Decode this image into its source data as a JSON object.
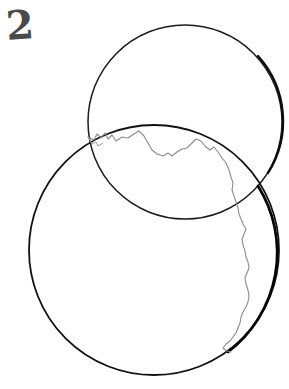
{
  "figure": {
    "number_label": "2",
    "caption": "",
    "background_color": "#ffffff",
    "ink_color": "#1a1a1a",
    "faint_ink_color": "#8a8a8a",
    "number_color": "#4a4a4a",
    "width": 289,
    "height": 389
  },
  "shapes": {
    "upper_circle": {
      "name": "upper-circle",
      "center_x": 185,
      "center_y": 122,
      "radius": 97,
      "stroke": "#1a1a1a",
      "stroke_width": 1.6,
      "fill": "none"
    },
    "lower_circle": {
      "name": "lower-circle",
      "center_x": 154,
      "center_y": 250,
      "radius": 125,
      "stroke": "#111111",
      "stroke_width": 1.9,
      "fill": "none"
    },
    "terminator_line": {
      "name": "jagged-terminator-line",
      "stroke": "#8a8a8a",
      "stroke_width": 1.1,
      "fill": "none",
      "description": "irregular coastline-like curve inside lower circle",
      "path": "M 88 137 L 94 140 L 97 134 L 101 138 L 105 133 L 108 139 L 112 135 L 116 141 L 122 137 L 128 138 L 134 134 L 139 131 L 144 136 L 148 143 L 152 150 L 157 154 L 163 156 L 168 153 L 172 156 L 177 152 L 182 149 L 187 148 L 192 143 L 196 139 L 201 141 L 205 146 L 210 150 L 214 147 L 218 152 L 222 158 L 226 163 L 229 170 L 231 177 L 233 183 L 232 190 L 234 196 L 236 202 L 238 208 L 239 214 L 241 219 L 243 224 L 246 229 L 244 234 L 242 239 L 243 245 L 245 251 L 246 257 L 248 262 L 249 268 L 247 273 L 245 278 L 246 284 L 248 290 L 249 296 L 248 302 L 246 307 L 243 312 L 241 317 L 240 323 L 238 328 L 236 333 L 233 337 L 230 341 L 226 344 L 223 348 L 227 351 L 231 352"
    },
    "shadow_strokes": [
      {
        "name": "upper-circle-shade-right",
        "description": "darker thickened arc on right of upper circle",
        "stroke": "#111111",
        "stroke_width": 2.4
      },
      {
        "name": "lower-circle-shade-right",
        "description": "darker thickened arc on lower-right of lower circle",
        "stroke": "#0a0a0a",
        "stroke_width": 2.6
      }
    ]
  },
  "intersections": {
    "left_point": {
      "x": 88,
      "y": 137
    },
    "right_point": {
      "x": 258,
      "y": 186
    }
  }
}
